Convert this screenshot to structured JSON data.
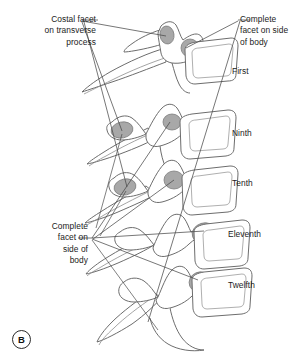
{
  "figure": {
    "panel_letter": "B",
    "title": "",
    "view": "lateral view of thoracic vertebrae showing costal facets"
  },
  "colors": {
    "background": "#ffffff",
    "bone_outline": "#6d6d6d",
    "bone_fill": "#ffffff",
    "facet_fill": "#a8a8a8",
    "facet_outline": "#7d7d7d",
    "leader_line": "#4a4a4a",
    "text": "#1b1b1b"
  },
  "callouts": [
    {
      "id": "costal-facet-on-transverse-process",
      "text": "Costal facet\non transverse\nprocess",
      "lines": [
        "Costal facet",
        "on transverse",
        "process"
      ],
      "align": "right",
      "anchor": {
        "x": 82,
        "y": 24
      },
      "targets": [
        {
          "x": 166,
          "y": 36
        },
        {
          "x": 122,
          "y": 131
        },
        {
          "x": 127,
          "y": 187
        }
      ]
    },
    {
      "id": "complete-facet-on-side-of-body-top",
      "text": "Complete\nfacet on side\nof body",
      "lines": [
        "Complete",
        "facet on side",
        "of body"
      ],
      "align": "left",
      "anchor": {
        "x": 237,
        "y": 20
      },
      "targets": [
        {
          "x": 183,
          "y": 47
        },
        {
          "x": 148,
          "y": 322
        }
      ]
    },
    {
      "id": "complete-facet-on-side-of-body-left",
      "text": "Complete\nfacet on\nside of\nbody",
      "lines": [
        "Complete",
        "facet on",
        "side of",
        "body"
      ],
      "align": "right",
      "anchor": {
        "x": 92,
        "y": 238
      },
      "targets": [
        {
          "x": 200,
          "y": 232
        },
        {
          "x": 196,
          "y": 277
        },
        {
          "x": 168,
          "y": 122
        },
        {
          "x": 172,
          "y": 181
        }
      ]
    }
  ],
  "level_labels": [
    {
      "id": "first",
      "text": "First"
    },
    {
      "id": "ninth",
      "text": "Ninth"
    },
    {
      "id": "tenth",
      "text": "Tenth"
    },
    {
      "id": "eleventh",
      "text": "Eleventh"
    },
    {
      "id": "twelfth",
      "text": "Twelfth"
    }
  ],
  "vertebrae": [
    {
      "id": "vertebra-first",
      "level": "First",
      "facets": [
        "costal facet on transverse process",
        "complete facet on side of body"
      ]
    },
    {
      "id": "vertebra-ninth",
      "level": "Ninth",
      "facets": [
        "costal facet on transverse process",
        "demifacet on side of body"
      ]
    },
    {
      "id": "vertebra-tenth",
      "level": "Tenth",
      "facets": [
        "costal facet on transverse process",
        "complete facet on side of body"
      ]
    },
    {
      "id": "vertebra-eleventh",
      "level": "Eleventh",
      "facets": [
        "complete facet on side of body"
      ]
    },
    {
      "id": "vertebra-twelfth",
      "level": "Twelfth",
      "facets": [
        "complete facet on side of body"
      ]
    }
  ]
}
